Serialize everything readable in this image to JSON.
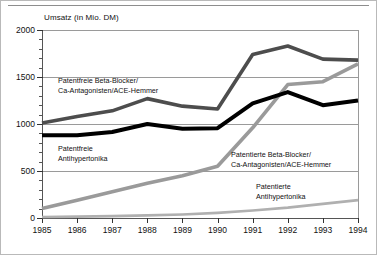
{
  "figure": {
    "axis_title": "Umsatz (in Mio. DM)"
  },
  "chart_data": {
    "type": "line",
    "title": "Umsatz (in Mio. DM)",
    "xlabel": "",
    "ylabel": "Umsatz (in Mio. DM)",
    "xlim": [
      1985,
      1994
    ],
    "ylim": [
      0,
      2000
    ],
    "yticks": [
      0,
      500,
      1000,
      1500,
      2000
    ],
    "ytick_labels": [
      "0",
      "500",
      "1000",
      "1500",
      "2000"
    ],
    "y_minor_tick_step": 100,
    "grid": "horizontal",
    "legend": "inline-annotations",
    "categories": [
      1985,
      1986,
      1987,
      1988,
      1989,
      1990,
      1991,
      1992,
      1993,
      1994
    ],
    "xtick_labels": [
      "1985",
      "1986",
      "1987",
      "1988",
      "1989",
      "1990",
      "1991",
      "1992",
      "1993",
      "1994"
    ],
    "series": [
      {
        "name": "Patentfreie Beta-Blocker/Ca-Antagonisten/ACE-Hemmer",
        "label_line1": "Patentfreie Beta-Blocker/",
        "label_line2": "Ca-Antagonisten/ACE-Hemmer",
        "color": "#4d4d4d",
        "style": "thick-dark-gray",
        "values": [
          1010,
          1080,
          1140,
          1270,
          1190,
          1160,
          1740,
          1830,
          1690,
          1680
        ]
      },
      {
        "name": "Patentfreie Antihypertonika",
        "label_line1": "Patentfreie",
        "label_line2": "Antihypertonika",
        "color": "#000000",
        "style": "thick-black",
        "values": [
          880,
          880,
          915,
          1000,
          950,
          955,
          1220,
          1340,
          1200,
          1250
        ]
      },
      {
        "name": "Patentierte Beta-Blocker/Ca-Antagonisten/ACE-Hemmer",
        "label_line1": "Patentierte Beta-Blocker/",
        "label_line2": "Ca-Antagonisten/ACE-Hemmer",
        "color": "#9a9a9a",
        "style": "thick-light-gray",
        "values": [
          100,
          190,
          280,
          370,
          450,
          550,
          960,
          1420,
          1450,
          1640
        ]
      },
      {
        "name": "Patentierte Antihypertonika",
        "label_line1": "Patentierte",
        "label_line2": "Antihypertonika",
        "color": "#b0b0b0",
        "style": "thin-light-gray",
        "values": [
          10,
          15,
          20,
          28,
          38,
          55,
          80,
          110,
          150,
          190
        ]
      }
    ]
  }
}
